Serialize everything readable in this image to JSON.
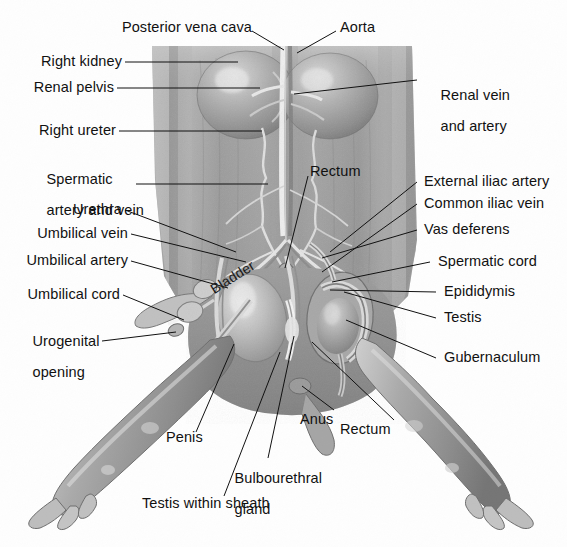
{
  "figure": {
    "background_color": "#fefefe",
    "line_color": "#111111",
    "text_color": "#111111"
  },
  "labels": {
    "posterior_vena_cava": "Posterior vena cava",
    "aorta": "Aorta",
    "right_kidney": "Right kidney",
    "renal_pelvis": "Renal pelvis",
    "right_ureter": "Right ureter",
    "spermatic_artery_and_vein_l1": "Spermatic",
    "spermatic_artery_and_vein_l2": "artery and vein",
    "urethra": "Urethra",
    "umbilical_vein": "Umbilical vein",
    "umbilical_artery": "Umbilical artery",
    "umbilical_cord": "Umbilical cord",
    "urogenital_opening_l1": "Urogenital",
    "urogenital_opening_l2": "opening",
    "renal_vein_and_artery_l1": "Renal vein",
    "renal_vein_and_artery_l2": "and artery",
    "rectum_upper": "Rectum",
    "external_iliac_artery": "External iliac artery",
    "common_iliac_vein": "Common iliac vein",
    "vas_deferens": "Vas deferens",
    "spermatic_cord": "Spermatic cord",
    "epididymis": "Epididymis",
    "testis": "Testis",
    "gubernaculum": "Gubernaculum",
    "bladder": "Bladder",
    "penis": "Penis",
    "anus": "Anus",
    "rectum_lower": "Rectum",
    "bulbourethral_gland_l1": "Bulbourethral",
    "bulbourethral_gland_l2": "gland",
    "testis_within_sheath": "Testis within sheath"
  }
}
